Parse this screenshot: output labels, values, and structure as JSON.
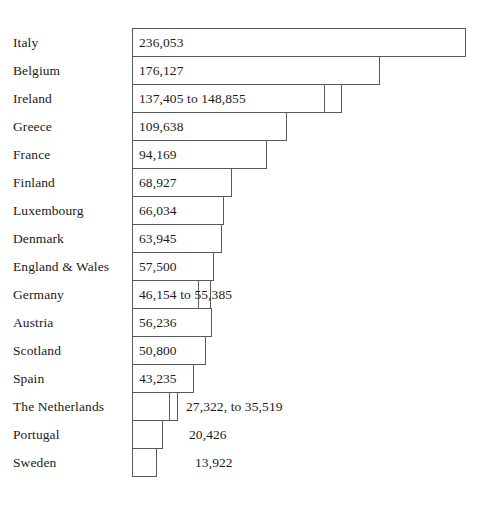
{
  "chart_data": {
    "type": "bar",
    "orientation": "horizontal",
    "title": "",
    "subtitle": "",
    "xlabel": "",
    "ylabel": "",
    "grid": false,
    "legend": null,
    "axis_visible": false,
    "xlim": [
      0,
      236053
    ],
    "categories": [
      "Italy",
      "Belgium",
      "Ireland",
      "Greece",
      "France",
      "Finland",
      "Luxembourg",
      "Denmark",
      "England & Wales",
      "Germany",
      "Austria",
      "Scotland",
      "Spain",
      "The Netherlands",
      "Portugal",
      "Sweden"
    ],
    "values": [
      236053,
      176127,
      148855,
      109638,
      94169,
      68927,
      66034,
      63945,
      57500,
      55385,
      56236,
      50800,
      43235,
      35519,
      20426,
      13922
    ],
    "bars": [
      {
        "label": "Italy",
        "value_text": "236,053",
        "value": 236053,
        "range": false,
        "label_position": "inside",
        "bar_px": 334,
        "ext_px": 0
      },
      {
        "label": "Belgium",
        "value_text": "176,127",
        "value": 176127,
        "range": false,
        "label_position": "inside",
        "bar_px": 248,
        "ext_px": 0
      },
      {
        "label": "Ireland",
        "value_text": "137,405 to 148,855",
        "value_low": 137405,
        "value_high": 148855,
        "range": true,
        "label_position": "inside",
        "bar_px": 193,
        "ext_px": 17
      },
      {
        "label": "Greece",
        "value_text": "109,638",
        "value": 109638,
        "range": false,
        "label_position": "inside",
        "bar_px": 155,
        "ext_px": 0
      },
      {
        "label": "France",
        "value_text": "94,169",
        "value": 94169,
        "range": false,
        "label_position": "inside",
        "bar_px": 135,
        "ext_px": 0
      },
      {
        "label": "Finland",
        "value_text": "68,927",
        "value": 68927,
        "range": false,
        "label_position": "inside",
        "bar_px": 100,
        "ext_px": 0
      },
      {
        "label": "Luxembourg",
        "value_text": "66,034",
        "value": 66034,
        "range": false,
        "label_position": "inside",
        "bar_px": 92,
        "ext_px": 0
      },
      {
        "label": "Denmark",
        "value_text": "63,945",
        "value": 63945,
        "range": false,
        "label_position": "inside",
        "bar_px": 90,
        "ext_px": 0
      },
      {
        "label": "England & Wales",
        "value_text": "57,500",
        "value": 57500,
        "range": false,
        "label_position": "inside",
        "bar_px": 82,
        "ext_px": 0
      },
      {
        "label": "Germany",
        "value_text": "46,154 to 55,385",
        "value_low": 46154,
        "value_high": 55385,
        "range": true,
        "label_position": "inside",
        "bar_px": 67,
        "ext_px": 12
      },
      {
        "label": "Austria",
        "value_text": "56,236",
        "value": 56236,
        "range": false,
        "label_position": "inside",
        "bar_px": 80,
        "ext_px": 0
      },
      {
        "label": "Scotland",
        "value_text": "50,800",
        "value": 50800,
        "range": false,
        "label_position": "inside",
        "bar_px": 74,
        "ext_px": 0
      },
      {
        "label": "Spain",
        "value_text": "43,235",
        "value": 43235,
        "range": false,
        "label_position": "inside",
        "bar_px": 62,
        "ext_px": 0
      },
      {
        "label": "The Netherlands",
        "value_text": "27,322, to 35,519",
        "value_low": 27322,
        "value_high": 35519,
        "range": true,
        "label_position": "outside",
        "bar_px": 38,
        "ext_px": 8,
        "value_offset_px": 54
      },
      {
        "label": "Portugal",
        "value_text": "20,426",
        "value": 20426,
        "range": false,
        "label_position": "outside",
        "bar_px": 31,
        "ext_px": 0,
        "value_offset_px": 57
      },
      {
        "label": "Sweden",
        "value_text": "13,922",
        "value": 13922,
        "range": false,
        "label_position": "outside",
        "bar_px": 25,
        "ext_px": 0,
        "value_offset_px": 63
      }
    ]
  }
}
